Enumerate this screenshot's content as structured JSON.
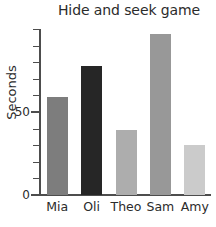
{
  "chart_data": {
    "type": "bar",
    "title": "Hide and seek game",
    "xlabel": "",
    "ylabel": "Seconds",
    "categories": [
      "Mia",
      "Oli",
      "Theo",
      "Sam",
      "Amy"
    ],
    "values": [
      59,
      78,
      39,
      97,
      30
    ],
    "ylim": [
      0,
      100
    ],
    "ytick_values": [
      0,
      10,
      20,
      30,
      40,
      50,
      60,
      70,
      80,
      90,
      100
    ],
    "ytick_labels": [
      "0",
      "",
      "",
      "",
      "",
      "50",
      "",
      "",
      "",
      "",
      ""
    ],
    "grid": false,
    "legend": false,
    "bar_colors": [
      "#7d7d7d",
      "#262626",
      "#adadad",
      "#989898",
      "#cbcbcb"
    ],
    "axis_color": "#4d4d4d",
    "text_color": "#2b2b2b"
  }
}
